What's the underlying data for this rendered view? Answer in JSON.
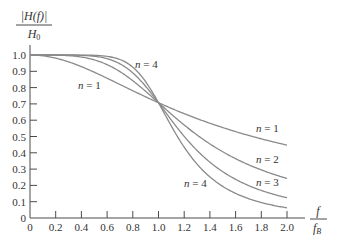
{
  "chart_data": {
    "type": "line",
    "title": "",
    "xlabel": "f / f_B",
    "ylabel": "|H(f)| / H_0",
    "xlabel_num": "f",
    "xlabel_den": "f_B",
    "ylabel_num": "|H(f)|",
    "ylabel_den": "H_0",
    "xlim": [
      0,
      2.0
    ],
    "ylim": [
      0,
      1.0
    ],
    "grid": false,
    "legend_position": "inline annotations",
    "x_ticks": [
      "0",
      "0.2",
      "0.4",
      "0.6",
      "0.8",
      "1.0",
      "1.2",
      "1.4",
      "1.6",
      "1.8",
      "2.0"
    ],
    "y_ticks": [
      "0",
      "0.1",
      "0.2",
      "0.3",
      "0.4",
      "0.5",
      "0.6",
      "0.7",
      "0.8",
      "0.9",
      "1.0"
    ],
    "x": [
      0,
      0.2,
      0.4,
      0.6,
      0.8,
      1.0,
      1.2,
      1.4,
      1.6,
      1.8,
      2.0
    ],
    "series": [
      {
        "name": "n = 1",
        "values": [
          1.0,
          0.981,
          0.928,
          0.857,
          0.781,
          0.707,
          0.64,
          0.581,
          0.53,
          0.486,
          0.447
        ]
      },
      {
        "name": "n = 2",
        "values": [
          1.0,
          0.999,
          0.987,
          0.941,
          0.842,
          0.707,
          0.57,
          0.455,
          0.364,
          0.295,
          0.243
        ]
      },
      {
        "name": "n = 3",
        "values": [
          1.0,
          1.0,
          0.998,
          0.977,
          0.888,
          0.707,
          0.501,
          0.343,
          0.237,
          0.169,
          0.124
        ]
      },
      {
        "name": "n = 4",
        "values": [
          1.0,
          1.0,
          1.0,
          0.992,
          0.925,
          0.707,
          0.434,
          0.252,
          0.151,
          0.095,
          0.062
        ]
      }
    ],
    "annotations": [
      {
        "text_var": "n",
        "text_val": "= 4",
        "x": 0.82,
        "y": 0.93
      },
      {
        "text_var": "n",
        "text_val": "= 1",
        "x": 0.37,
        "y": 0.79
      },
      {
        "text_var": "n",
        "text_val": "= 1",
        "x": 1.75,
        "y": 0.55
      },
      {
        "text_var": "n",
        "text_val": "= 2",
        "x": 1.75,
        "y": 0.36
      },
      {
        "text_var": "n",
        "text_val": "= 3",
        "x": 1.75,
        "y": 0.22
      },
      {
        "text_var": "n",
        "text_val": "= 4",
        "x": 1.2,
        "y": 0.22
      }
    ]
  },
  "labels": {
    "ann_var": "n",
    "ann": [
      "= 4",
      "= 1",
      "= 1",
      "= 2",
      "= 3",
      "= 4"
    ]
  }
}
